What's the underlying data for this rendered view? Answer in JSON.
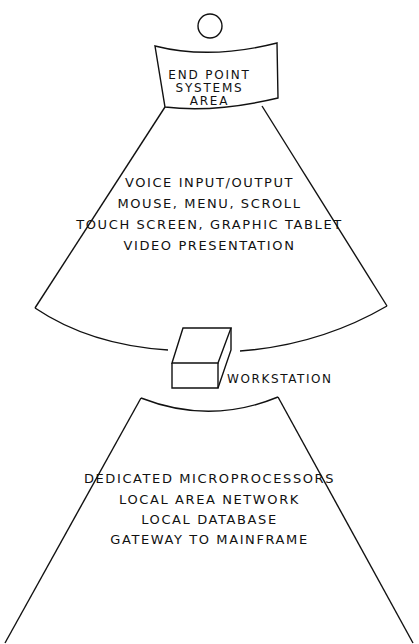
{
  "diagram": {
    "top_cap": {
      "lines": [
        "END POINT",
        "SYSTEMS",
        "AREA"
      ]
    },
    "upper_fan": {
      "items": [
        "VOICE INPUT/OUTPUT",
        "MOUSE, MENU, SCROLL",
        "TOUCH SCREEN, GRAPHIC TABLET",
        "VIDEO PRESENTATION"
      ]
    },
    "center_node": {
      "label": "WORKSTATION",
      "icon": "box-icon"
    },
    "lower_fan": {
      "items": [
        "DEDICATED MICROPROCESSORS",
        "LOCAL AREA NETWORK",
        "LOCAL DATABASE",
        "GATEWAY TO MAINFRAME"
      ]
    },
    "colors": {
      "stroke": "#111111",
      "background": "#ffffff"
    }
  }
}
